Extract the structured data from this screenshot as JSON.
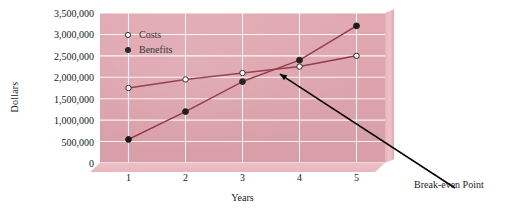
{
  "chart_data": {
    "type": "line",
    "title": "",
    "xlabel": "Years",
    "ylabel": "Dollars",
    "x": [
      1,
      2,
      3,
      4,
      5
    ],
    "xtick_labels": [
      "1",
      "2",
      "3",
      "4",
      "5"
    ],
    "ytick_labels": [
      "0",
      "500,000",
      "1,000,000",
      "1,500,000",
      "2,000,000",
      "2,500,000",
      "3,000,000",
      "3,500,000"
    ],
    "ytick_values": [
      0,
      500000,
      1000000,
      1500000,
      2000000,
      2500000,
      3000000,
      3500000
    ],
    "ylim": [
      0,
      3500000
    ],
    "xlim": [
      0.5,
      5.5
    ],
    "grid": true,
    "legend_position": "top-left-inside",
    "series": [
      {
        "name": "Costs",
        "marker": "open-circle",
        "values": [
          1750000,
          1950000,
          2100000,
          2250000,
          2500000
        ]
      },
      {
        "name": "Benefits",
        "marker": "filled-circle",
        "values": [
          550000,
          1200000,
          1900000,
          2400000,
          3200000
        ]
      }
    ],
    "annotations": [
      {
        "text": "Break-even Point",
        "x": 3.6,
        "y": 2150000
      }
    ]
  },
  "legend": {
    "items": [
      {
        "label": "Costs",
        "marker": "open-circle"
      },
      {
        "label": "Benefits",
        "marker": "filled-circle"
      }
    ]
  },
  "colors": {
    "plot_background": "#e0a4ad",
    "panel_side": "#edc3c9",
    "gridline": "#ffffff",
    "series_line": "#8e2f41",
    "annotation_line": "#000000",
    "text": "#1a1a1a",
    "page_background": "#ffffff"
  }
}
